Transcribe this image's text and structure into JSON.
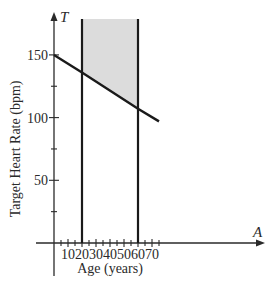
{
  "chart_data": {
    "type": "line",
    "title": "",
    "xlabel": "Age (years)",
    "ylabel": "Target Heart Rate (bpm)",
    "x_axis_var": "A",
    "y_axis_var": "T",
    "xlim": [
      0,
      75
    ],
    "ylim": [
      0,
      175
    ],
    "x_ticks": [
      10,
      20,
      30,
      40,
      50,
      60,
      70
    ],
    "x_tick_labels": [
      "10",
      "20",
      "30",
      "40",
      "50",
      "60",
      "70"
    ],
    "x_minor_step": 5,
    "y_ticks": [
      50,
      100,
      150
    ],
    "y_tick_labels": [
      "50",
      "100",
      "150"
    ],
    "y_minor_step": 25,
    "grid": false,
    "series": [
      {
        "name": "T = 0.7(220 - A)",
        "x": [
          0,
          20,
          60,
          75
        ],
        "values": [
          150,
          136,
          107,
          97
        ]
      }
    ],
    "vertical_lines": [
      {
        "x": 20,
        "label": "A = 20"
      },
      {
        "x": 60,
        "label": "A = 60"
      }
    ],
    "shaded_region": {
      "description": "Region between A = 20 and A = 60, above the line",
      "x_range": [
        20,
        60
      ],
      "fill": "#dcdcdc"
    }
  },
  "colors": {
    "line": "#1a1a1a",
    "axis": "#2a2a2a",
    "shade": "#dcdcdc"
  }
}
